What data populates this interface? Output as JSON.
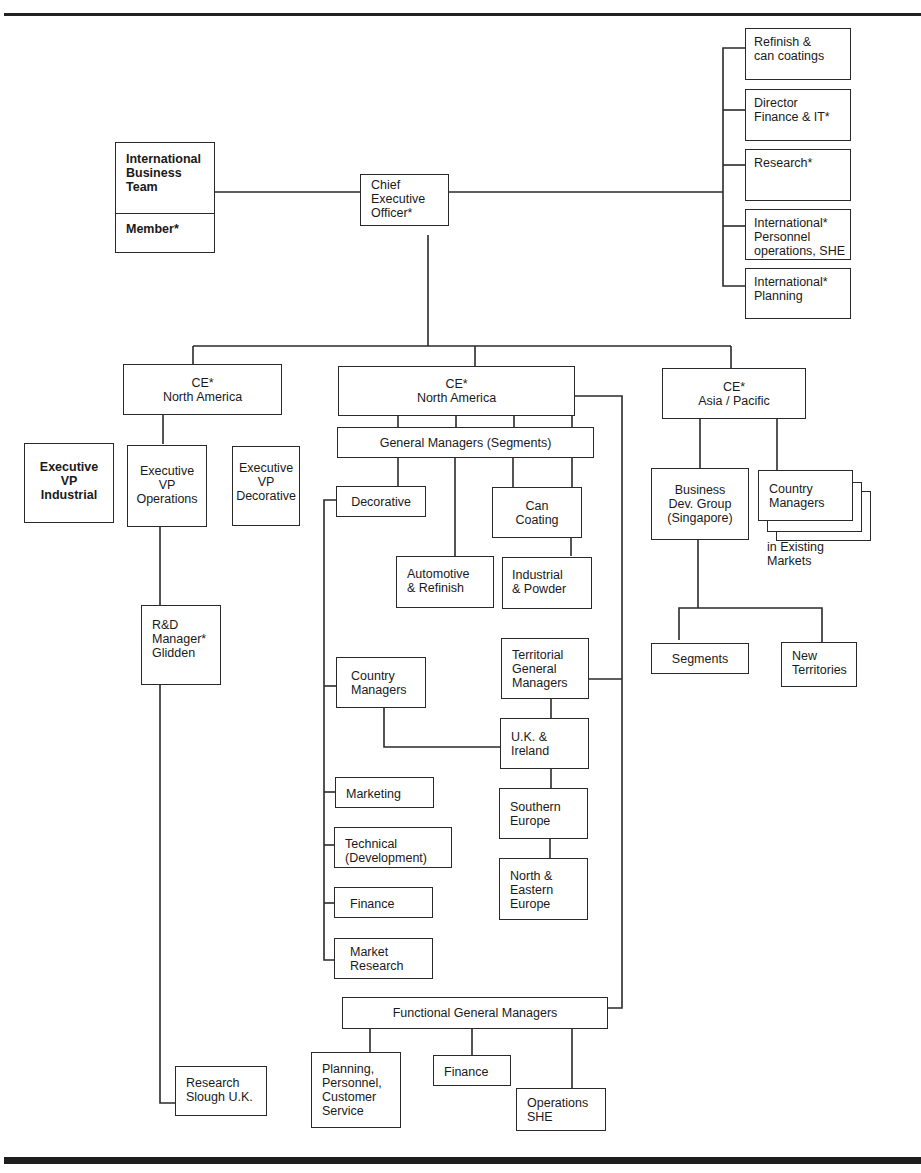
{
  "figure": {
    "type": "organization chart"
  },
  "top": {
    "ceo": "Chief\nExecutive\nOfficer*",
    "ibt": {
      "title": "International\nBusiness\nTeam",
      "member": "Member*"
    },
    "staff": [
      "Refinish &\ncan coatings",
      "Director\nFinance & IT*",
      "Research*",
      "International*\nPersonnel\noperations, SHE",
      "International*\nPlanning"
    ]
  },
  "left": {
    "ce": "CE*\nNorth America",
    "vps": [
      "Executive\nVP\nIndustrial",
      "Executive\nVP\nOperations",
      "Executive\nVP\nDecorative"
    ],
    "rd": "R&D\nManager*\nGlidden",
    "research": "Research\nSlough U.K."
  },
  "middle": {
    "ce": "CE*\nNorth America",
    "gm_segments": "General Managers (Segments)",
    "segments": {
      "decorative": "Decorative",
      "can_coating": "Can\nCoating",
      "automotive": "Automotive\n& Refinish",
      "industrial": "Industrial\n& Powder"
    },
    "decorative_units": [
      "Country\nManagers",
      "Marketing",
      "Technical\n(Development)",
      "Finance",
      "Market\nResearch"
    ],
    "territorial": {
      "head": "Territorial\nGeneral\nManagers",
      "regions": [
        "U.K. &\nIreland",
        "Southern\nEurope",
        "North &\nEastern\nEurope"
      ]
    },
    "functional": {
      "head": "Functional General Managers",
      "units": [
        "Planning,\nPersonnel,\nCustomer\nService",
        "Finance",
        "Operations\nSHE"
      ]
    }
  },
  "right": {
    "ce": "CE*\nAsia / Pacific",
    "bdg": "Business\nDev. Group\n(Singapore)",
    "country_managers": "Country\nManagers",
    "country_note": "in Existing\nMarkets",
    "segments": "Segments",
    "new_territories": "New\nTerritories"
  }
}
